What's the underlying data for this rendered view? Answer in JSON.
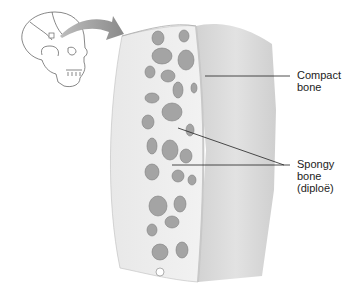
{
  "diagram": {
    "labels": {
      "compact": [
        "Compact",
        "bone"
      ],
      "spongy": [
        "Spongy",
        "bone",
        "(diploë)"
      ]
    },
    "icons": {
      "skull": "skull-illustration",
      "arrow": "curved-arrow",
      "bone_block": "bone-section-illustration"
    }
  }
}
